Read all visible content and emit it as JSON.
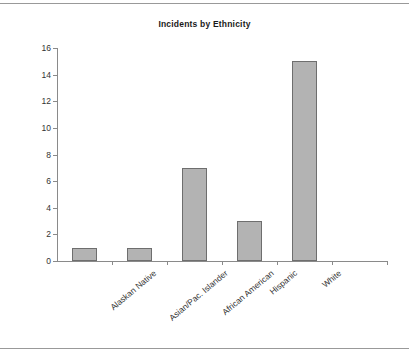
{
  "chart_data": {
    "type": "bar",
    "title": "Incidents by Ethnicity",
    "xlabel": "",
    "ylabel": "",
    "categories": [
      "Alaskan Native",
      "Asian/Pac. Islander",
      "African American",
      "Hispanic",
      "White"
    ],
    "values": [
      1,
      1,
      7,
      3,
      15
    ],
    "ylim": [
      0,
      16
    ],
    "ytick_values": [
      0,
      2,
      4,
      6,
      8,
      10,
      12,
      14,
      16
    ],
    "ytick_labels": [
      "0",
      "2",
      "4",
      "6",
      "8",
      "10",
      "12",
      "14",
      "16"
    ],
    "grid": false,
    "legend": "none",
    "bar_color": "#b3b3b3",
    "bar_border_color": "#6e6e6e",
    "axis_color": "#8a8a8a",
    "text_color": "#333333",
    "title_color": "#1a1a1a",
    "xtick_slots": 6,
    "xlabel_rotation": -40
  }
}
